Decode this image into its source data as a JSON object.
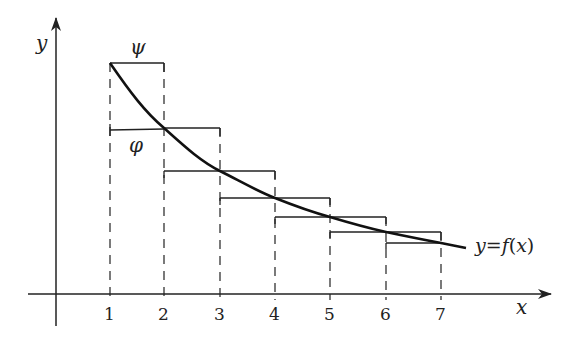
{
  "diagram": {
    "type": "step-function-bounds",
    "axes": {
      "x_label": "x",
      "y_label": "y",
      "x_ticks": [
        "1",
        "2",
        "3",
        "4",
        "5",
        "6",
        "7"
      ]
    },
    "curve": {
      "label": "y=f(x)",
      "label_parts": {
        "y": "y",
        "eq": "=",
        "f": "f",
        "open": "(",
        "x": "x",
        "close": ")"
      },
      "description": "decreasing curve from x=1 to beyond x=7"
    },
    "step_labels": {
      "upper": "ψ",
      "lower": "φ"
    },
    "upper_steps": [
      {
        "from": 1,
        "to": 2
      },
      {
        "from": 2,
        "to": 3
      },
      {
        "from": 3,
        "to": 4
      },
      {
        "from": 4,
        "to": 5
      },
      {
        "from": 5,
        "to": 6
      },
      {
        "from": 6,
        "to": 7
      }
    ],
    "lower_steps": [
      {
        "from": 1,
        "to": 2
      },
      {
        "from": 2,
        "to": 3
      },
      {
        "from": 3,
        "to": 4
      },
      {
        "from": 4,
        "to": 5
      },
      {
        "from": 5,
        "to": 6
      },
      {
        "from": 6,
        "to": 7
      }
    ]
  }
}
